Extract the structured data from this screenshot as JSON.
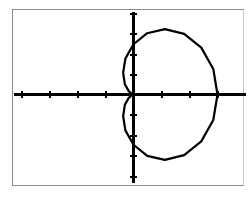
{
  "screen": {
    "label": "graphing-calculator-plot",
    "background_color": "#ffffff",
    "frame_color": "#8a8a8a"
  },
  "chart_data": {
    "type": "line",
    "title": "",
    "subtitle": "",
    "xlabel": "",
    "ylabel": "",
    "curve_name": "cardioid",
    "coordinate_system": "polar",
    "equation": "r = a(1 + cos θ)",
    "axis_color": "#000000",
    "curve_color": "#000000",
    "grid": false,
    "legend": false,
    "legend_position": "none",
    "tick_labels_shown": false,
    "xlim": [
      -4.7,
      4.1
    ],
    "ylim": [
      -3.1,
      2.8
    ],
    "xticks": [
      -4,
      -3,
      -2,
      -1,
      0,
      1,
      2,
      3
    ],
    "yticks": [
      -3,
      -2,
      -1,
      0,
      1,
      2
    ],
    "tick_spacing_x": 1,
    "tick_spacing_y": 1,
    "x_axis_y_value": 0,
    "y_axis_x_value": 0,
    "cusp_point": [
      0,
      0
    ],
    "rightmost_point": [
      3,
      0
    ],
    "topmost_point": [
      1.5,
      1.0
    ],
    "bottommost_point": [
      1.5,
      -1.0
    ],
    "series": [
      {
        "name": "cardioid",
        "theta_degrees": [
          0,
          15,
          30,
          45,
          60,
          75,
          90,
          105,
          120,
          135,
          150,
          165,
          180,
          195,
          210,
          225,
          240,
          255,
          270,
          285,
          300,
          315,
          330,
          345,
          360
        ],
        "r": [
          3.0,
          2.95,
          2.8,
          2.56,
          2.25,
          1.89,
          1.5,
          1.11,
          0.75,
          0.44,
          0.2,
          0.05,
          0.0,
          0.05,
          0.2,
          0.44,
          0.75,
          1.11,
          1.5,
          1.89,
          2.25,
          2.56,
          2.8,
          2.95,
          3.0
        ],
        "x": [
          3.0,
          2.85,
          2.42,
          1.81,
          1.12,
          0.49,
          0.0,
          -0.29,
          -0.37,
          -0.31,
          -0.17,
          -0.05,
          0.0,
          -0.05,
          -0.17,
          -0.31,
          -0.37,
          -0.29,
          0.0,
          0.49,
          1.12,
          1.81,
          2.42,
          2.85,
          3.0
        ],
        "y": [
          0.0,
          0.76,
          1.4,
          1.81,
          1.95,
          1.83,
          1.5,
          1.07,
          0.65,
          0.31,
          0.1,
          0.01,
          0.0,
          -0.01,
          -0.1,
          -0.31,
          -0.65,
          -1.07,
          -1.5,
          -1.83,
          -1.95,
          -1.81,
          -1.4,
          -0.76,
          0.0
        ]
      }
    ]
  }
}
